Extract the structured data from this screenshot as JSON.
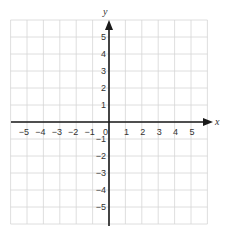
{
  "chart_data": {
    "type": "coordinate-grid",
    "title": "",
    "xlabel": "x",
    "ylabel": "y",
    "xlim": [
      -6,
      6
    ],
    "ylim": [
      -6,
      6
    ],
    "grid": true,
    "x_tick_labels": [
      "-5",
      "-4",
      "-3",
      "-2",
      "-1",
      "0",
      "1",
      "2",
      "3",
      "4",
      "5"
    ],
    "y_tick_labels": [
      "5",
      "4",
      "3",
      "2",
      "1",
      "-1",
      "-2",
      "-3",
      "-4",
      "-5"
    ],
    "x_ticks": [
      -5,
      -4,
      -3,
      -2,
      -1,
      1,
      2,
      3,
      4,
      5
    ],
    "y_ticks": [
      5,
      4,
      3,
      2,
      1,
      -1,
      -2,
      -3,
      -4,
      -5
    ],
    "origin_label": "0",
    "colors": {
      "grid": "#d6d6d6",
      "axis": "#1a1a1a",
      "text": "#333333"
    }
  },
  "labels": {
    "x_axis": "x",
    "y_axis": "y",
    "origin": "0",
    "x_neg": [
      "−5",
      "−4",
      "−3",
      "−2",
      "−1"
    ],
    "x_pos": [
      "1",
      "2",
      "3",
      "4",
      "5"
    ],
    "y_pos": [
      "5",
      "4",
      "3",
      "2",
      "1"
    ],
    "y_neg": [
      "−1",
      "−2",
      "−3",
      "−4",
      "−5"
    ]
  }
}
